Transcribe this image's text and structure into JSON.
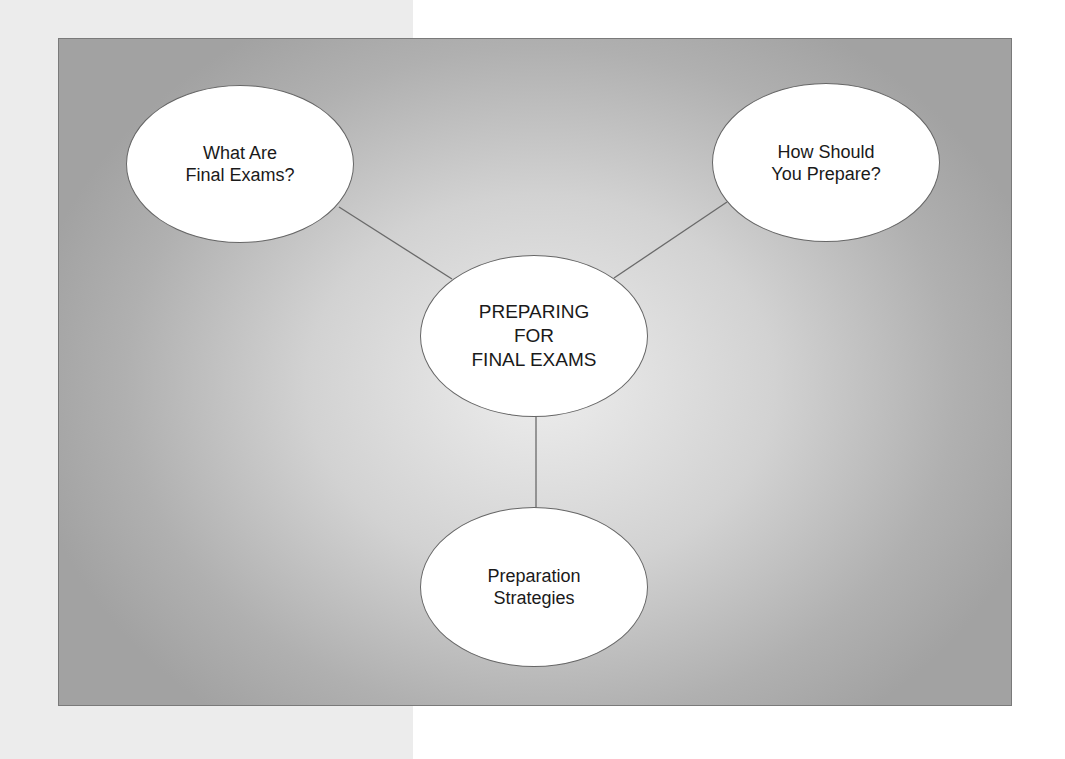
{
  "diagram": {
    "type": "concept-map",
    "center": {
      "lines": [
        "PREPARING",
        "FOR",
        "FINAL EXAMS"
      ]
    },
    "nodes": [
      {
        "id": "top-left",
        "lines": [
          "What Are",
          "Final Exams?"
        ]
      },
      {
        "id": "top-right",
        "lines": [
          "How Should",
          "You Prepare?"
        ]
      },
      {
        "id": "bottom",
        "lines": [
          "Preparation",
          "Strategies"
        ]
      }
    ],
    "colors": {
      "node_fill": "#ffffff",
      "node_border": "#666666",
      "connector": "#6a6a6a",
      "box_center": "#ededed",
      "box_edge": "#a2a2a2",
      "left_panel": "#ececec"
    }
  }
}
